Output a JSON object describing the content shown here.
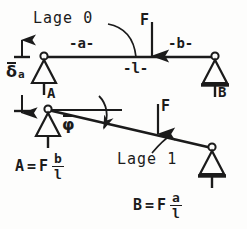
{
  "figure": {
    "width": 247,
    "height": 229,
    "ink_color": "#1b1b1b",
    "background": "#fdfdfc"
  },
  "labels": {
    "lage0": "Lage 0",
    "lage1": "Lage 1",
    "dim_a": "-a-",
    "dim_b": "-b-",
    "dim_l": "-l-",
    "force_top": "F",
    "force_bottom": "F",
    "support_a": "A",
    "support_b": "B",
    "delta_symbol": "δ",
    "delta_subscript": "a",
    "phi_symbol": "φ"
  },
  "formulas": {
    "reaction_a": {
      "lhs": "A",
      "equals": "=",
      "factor": "F",
      "numerator": "b",
      "denominator": "l"
    },
    "reaction_b": {
      "lhs": "B",
      "equals": "=",
      "factor": "F",
      "numerator": "a",
      "denominator": "l"
    }
  },
  "geometry": {
    "beam0": {
      "x1": 44,
      "y1": 57,
      "x2": 215,
      "y2": 57
    },
    "beam1": {
      "x1": 48,
      "y1": 110,
      "x2": 212,
      "y2": 148
    },
    "load_x_top": 152,
    "load_x_bottom": 158,
    "reference_line": {
      "x1": 48,
      "y1": 110,
      "x2": 122,
      "y2": 110
    },
    "delta_dim": {
      "x": 22,
      "y_top": 44,
      "y_bottom": 112
    }
  }
}
